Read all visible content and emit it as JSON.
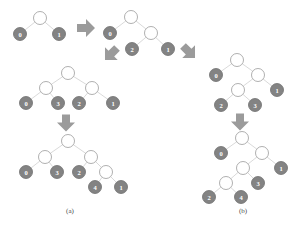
{
  "figure": {
    "background_color": "#ffffff",
    "node_fill_leaf": "#838383",
    "node_fill_internal": "#ffffff",
    "node_stroke": "#9a9a9a",
    "edge_color": "#c9c9c9",
    "arrow_color": "#9b9b9b",
    "label_color": "#ffffff",
    "caption_color": "#4a4a4a"
  },
  "captions": [
    {
      "id": "caption-a",
      "text": "(a)",
      "x": 70,
      "y": 211
    },
    {
      "id": "caption-b",
      "text": "(b)",
      "x": 243,
      "y": 211
    }
  ],
  "trees": [
    {
      "id": "tree-initial",
      "name": "tree-step-1",
      "nodes": [
        {
          "id": "t1-root",
          "label": "",
          "type": "internal",
          "x": 40,
          "y": 18,
          "r": 6.5
        },
        {
          "id": "t1-leaf-0",
          "label": "0",
          "type": "leaf",
          "x": 20,
          "y": 34,
          "r": 6.5
        },
        {
          "id": "t1-leaf-1",
          "label": "1",
          "type": "leaf",
          "x": 59,
          "y": 34,
          "r": 6.5
        }
      ],
      "edges": [
        {
          "from": "t1-root",
          "to": "t1-leaf-0"
        },
        {
          "from": "t1-root",
          "to": "t1-leaf-1"
        }
      ]
    },
    {
      "id": "tree-step-2",
      "name": "tree-step-2",
      "nodes": [
        {
          "id": "t2-root",
          "label": "",
          "type": "internal",
          "x": 131,
          "y": 17,
          "r": 6.5
        },
        {
          "id": "t2-leaf-0",
          "label": "0",
          "type": "leaf",
          "x": 110,
          "y": 33,
          "r": 6.5
        },
        {
          "id": "t2-inner",
          "label": "",
          "type": "internal",
          "x": 151,
          "y": 33,
          "r": 6.5
        },
        {
          "id": "t2-leaf-2",
          "label": "2",
          "type": "leaf",
          "x": 132,
          "y": 49,
          "r": 6.5
        },
        {
          "id": "t2-leaf-1",
          "label": "1",
          "type": "leaf",
          "x": 168,
          "y": 49,
          "r": 6.5
        }
      ],
      "edges": [
        {
          "from": "t2-root",
          "to": "t2-leaf-0"
        },
        {
          "from": "t2-root",
          "to": "t2-inner"
        },
        {
          "from": "t2-inner",
          "to": "t2-leaf-2"
        },
        {
          "from": "t2-inner",
          "to": "t2-leaf-1"
        }
      ]
    },
    {
      "id": "tree-left-step-3",
      "name": "tree-left-branch-step-3",
      "nodes": [
        {
          "id": "t3-root",
          "label": "",
          "type": "internal",
          "x": 68,
          "y": 73,
          "r": 6.5
        },
        {
          "id": "t3-left",
          "label": "",
          "type": "internal",
          "x": 46,
          "y": 88,
          "r": 6.5
        },
        {
          "id": "t3-right",
          "label": "",
          "type": "internal",
          "x": 92,
          "y": 88,
          "r": 6.5
        },
        {
          "id": "t3-leaf-0",
          "label": "0",
          "type": "leaf",
          "x": 26,
          "y": 103,
          "r": 6.5
        },
        {
          "id": "t3-leaf-3",
          "label": "3",
          "type": "leaf",
          "x": 58,
          "y": 103,
          "r": 6.5
        },
        {
          "id": "t3-leaf-2",
          "label": "2",
          "type": "leaf",
          "x": 79,
          "y": 103,
          "r": 6.5
        },
        {
          "id": "t3-leaf-1",
          "label": "1",
          "type": "leaf",
          "x": 113,
          "y": 103,
          "r": 6.5
        }
      ],
      "edges": [
        {
          "from": "t3-root",
          "to": "t3-left"
        },
        {
          "from": "t3-root",
          "to": "t3-right"
        },
        {
          "from": "t3-left",
          "to": "t3-leaf-0"
        },
        {
          "from": "t3-left",
          "to": "t3-leaf-3"
        },
        {
          "from": "t3-right",
          "to": "t3-leaf-2"
        },
        {
          "from": "t3-right",
          "to": "t3-leaf-1"
        }
      ]
    },
    {
      "id": "tree-left-final",
      "name": "tree-left-branch-final-a",
      "nodes": [
        {
          "id": "t4-root",
          "label": "",
          "type": "internal",
          "x": 68,
          "y": 141,
          "r": 6.5
        },
        {
          "id": "t4-left",
          "label": "",
          "type": "internal",
          "x": 45,
          "y": 157,
          "r": 6.5
        },
        {
          "id": "t4-right",
          "label": "",
          "type": "internal",
          "x": 91,
          "y": 157,
          "r": 6.5
        },
        {
          "id": "t4-leaf-0",
          "label": "0",
          "type": "leaf",
          "x": 26,
          "y": 172,
          "r": 6.5
        },
        {
          "id": "t4-leaf-3",
          "label": "3",
          "type": "leaf",
          "x": 57,
          "y": 172,
          "r": 6.5
        },
        {
          "id": "t4-leaf-2",
          "label": "2",
          "type": "leaf",
          "x": 79,
          "y": 172,
          "r": 6.5
        },
        {
          "id": "t4-inner",
          "label": "",
          "type": "internal",
          "x": 106,
          "y": 172,
          "r": 6.5
        },
        {
          "id": "t4-leaf-4",
          "label": "4",
          "type": "leaf",
          "x": 95,
          "y": 187,
          "r": 6.5
        },
        {
          "id": "t4-leaf-1",
          "label": "1",
          "type": "leaf",
          "x": 121,
          "y": 187,
          "r": 6.5
        }
      ],
      "edges": [
        {
          "from": "t4-root",
          "to": "t4-left"
        },
        {
          "from": "t4-root",
          "to": "t4-right"
        },
        {
          "from": "t4-left",
          "to": "t4-leaf-0"
        },
        {
          "from": "t4-left",
          "to": "t4-leaf-3"
        },
        {
          "from": "t4-right",
          "to": "t4-leaf-2"
        },
        {
          "from": "t4-right",
          "to": "t4-inner"
        },
        {
          "from": "t4-inner",
          "to": "t4-leaf-4"
        },
        {
          "from": "t4-inner",
          "to": "t4-leaf-1"
        }
      ]
    },
    {
      "id": "tree-right-step-3",
      "name": "tree-right-branch-step-3",
      "nodes": [
        {
          "id": "t5-root",
          "label": "",
          "type": "internal",
          "x": 237,
          "y": 60,
          "r": 6.5
        },
        {
          "id": "t5-leaf-0",
          "label": "0",
          "type": "leaf",
          "x": 216,
          "y": 75,
          "r": 6.5
        },
        {
          "id": "t5-right",
          "label": "",
          "type": "internal",
          "x": 258,
          "y": 75,
          "r": 6.5
        },
        {
          "id": "t5-inner",
          "label": "",
          "type": "internal",
          "x": 238,
          "y": 90,
          "r": 6.5
        },
        {
          "id": "t5-leaf-1",
          "label": "1",
          "type": "leaf",
          "x": 277,
          "y": 90,
          "r": 6.5
        },
        {
          "id": "t5-leaf-2",
          "label": "2",
          "type": "leaf",
          "x": 221,
          "y": 105,
          "r": 6.5
        },
        {
          "id": "t5-leaf-3",
          "label": "3",
          "type": "leaf",
          "x": 255,
          "y": 105,
          "r": 6.5
        }
      ],
      "edges": [
        {
          "from": "t5-root",
          "to": "t5-leaf-0"
        },
        {
          "from": "t5-root",
          "to": "t5-right"
        },
        {
          "from": "t5-right",
          "to": "t5-inner"
        },
        {
          "from": "t5-right",
          "to": "t5-leaf-1"
        },
        {
          "from": "t5-inner",
          "to": "t5-leaf-2"
        },
        {
          "from": "t5-inner",
          "to": "t5-leaf-3"
        }
      ]
    },
    {
      "id": "tree-right-final",
      "name": "tree-right-branch-final-b",
      "nodes": [
        {
          "id": "t6-root",
          "label": "",
          "type": "internal",
          "x": 242,
          "y": 138,
          "r": 6.5
        },
        {
          "id": "t6-leaf-0",
          "label": "0",
          "type": "leaf",
          "x": 221,
          "y": 153,
          "r": 6.5
        },
        {
          "id": "t6-right",
          "label": "",
          "type": "internal",
          "x": 262,
          "y": 153,
          "r": 6.5
        },
        {
          "id": "t6-inner",
          "label": "",
          "type": "internal",
          "x": 243,
          "y": 168,
          "r": 6.5
        },
        {
          "id": "t6-leaf-1",
          "label": "1",
          "type": "leaf",
          "x": 281,
          "y": 168,
          "r": 6.5
        },
        {
          "id": "t6-inner2",
          "label": "",
          "type": "internal",
          "x": 226,
          "y": 183,
          "r": 6.5
        },
        {
          "id": "t6-leaf-3",
          "label": "3",
          "type": "leaf",
          "x": 258,
          "y": 183,
          "r": 6.5
        },
        {
          "id": "t6-leaf-2",
          "label": "2",
          "type": "leaf",
          "x": 209,
          "y": 197,
          "r": 6.5
        },
        {
          "id": "t6-leaf-4",
          "label": "4",
          "type": "leaf",
          "x": 241,
          "y": 197,
          "r": 6.5
        }
      ],
      "edges": [
        {
          "from": "t6-root",
          "to": "t6-leaf-0"
        },
        {
          "from": "t6-root",
          "to": "t6-right"
        },
        {
          "from": "t6-right",
          "to": "t6-inner"
        },
        {
          "from": "t6-right",
          "to": "t6-leaf-1"
        },
        {
          "from": "t6-inner",
          "to": "t6-inner2"
        },
        {
          "from": "t6-inner",
          "to": "t6-leaf-3"
        },
        {
          "from": "t6-inner2",
          "to": "t6-leaf-2"
        },
        {
          "from": "t6-inner2",
          "to": "t6-leaf-4"
        }
      ]
    }
  ],
  "arrows": [
    {
      "id": "arrow-right-1",
      "name": "arrow-right",
      "direction": "right",
      "cx": 86,
      "cy": 28,
      "length": 18,
      "thickness": 8,
      "head": 9
    },
    {
      "id": "arrow-diag-left",
      "name": "arrow-down-left",
      "direction": "down-left",
      "cx": 111,
      "cy": 54,
      "length": 17,
      "thickness": 8,
      "head": 9
    },
    {
      "id": "arrow-diag-right",
      "name": "arrow-down-right",
      "direction": "down-right",
      "cx": 189,
      "cy": 52,
      "length": 17,
      "thickness": 8,
      "head": 9
    },
    {
      "id": "arrow-down-left-col",
      "name": "arrow-down",
      "direction": "down",
      "cx": 66,
      "cy": 123,
      "length": 17,
      "thickness": 8,
      "head": 9
    },
    {
      "id": "arrow-down-right-col",
      "name": "arrow-down",
      "direction": "down",
      "cx": 240,
      "cy": 122,
      "length": 17,
      "thickness": 8,
      "head": 9
    }
  ]
}
